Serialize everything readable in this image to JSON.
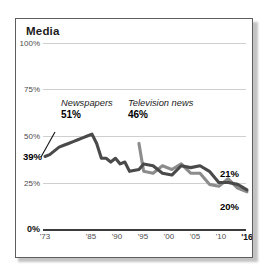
{
  "chart_data": {
    "type": "line",
    "title": "Media",
    "xlabel": "",
    "ylabel": "",
    "ylim": [
      0,
      100
    ],
    "xlim": [
      1973,
      2016
    ],
    "grid": true,
    "legend": "annotations-inline",
    "ytick_labels": [
      "0%",
      "25%",
      "50%",
      "75%",
      "100%"
    ],
    "ytick_values": [
      0,
      25,
      50,
      75,
      100
    ],
    "xtick_labels": [
      "'73",
      "'85",
      "'90",
      "'95",
      "'00",
      "'05",
      "'10",
      "'16"
    ],
    "xtick_values": [
      1973,
      1985,
      1990,
      1995,
      2000,
      2005,
      2010,
      2016
    ],
    "annotations": [
      {
        "name": "newspapers-label",
        "series": "Newspapers",
        "value_label": "51%",
        "value": 51,
        "year": 1983
      },
      {
        "name": "start-value-label",
        "value_label": "39%",
        "value": 39,
        "year": 1973
      },
      {
        "name": "television-news-label",
        "series": "Television news",
        "value_label": "46%",
        "value": 46,
        "year": 1993
      },
      {
        "name": "newspapers-end-label",
        "value_label": "21%",
        "value": 21,
        "year": 2016
      },
      {
        "name": "television-news-end-label",
        "value_label": "20%",
        "value": 20,
        "year": 2016
      }
    ],
    "series": [
      {
        "name": "Newspapers",
        "color": "#4a4a4a",
        "x": [
          1973,
          1974,
          1975,
          1976,
          1977,
          1978,
          1979,
          1980,
          1981,
          1982,
          1983,
          1984,
          1985,
          1986,
          1987,
          1988,
          1989,
          1990,
          1991,
          1993,
          1994,
          1996,
          1998,
          2000,
          2002,
          2004,
          2006,
          2008,
          2010,
          2012,
          2014,
          2016
        ],
        "values": [
          39,
          40,
          42,
          44,
          45,
          46,
          47,
          48,
          49,
          50,
          51,
          46,
          38,
          38,
          36,
          38,
          35,
          36,
          31,
          32,
          35,
          34,
          30,
          29,
          34,
          33,
          34,
          31,
          25,
          25,
          24,
          21
        ]
      },
      {
        "name": "Television news",
        "color": "#8c8c8c",
        "x": [
          1993,
          1994,
          1996,
          1998,
          2000,
          2002,
          2004,
          2006,
          2008,
          2010,
          2012,
          2014,
          2016
        ],
        "values": [
          46,
          31,
          30,
          34,
          32,
          35,
          30,
          30,
          24,
          23,
          27,
          22,
          20
        ]
      }
    ]
  }
}
